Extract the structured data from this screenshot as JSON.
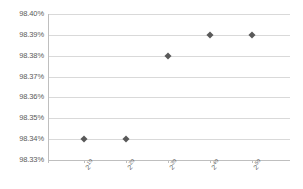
{
  "chart_data": {
    "type": "scatter",
    "title": "",
    "xlabel": "",
    "ylabel": "",
    "categories": [
      "2^10",
      "2^20",
      "2^30",
      "2^40",
      "2^50"
    ],
    "x_tick_labels": [
      {
        "base": "2",
        "exponent": "10"
      },
      {
        "base": "2",
        "exponent": "20"
      },
      {
        "base": "2",
        "exponent": "30"
      },
      {
        "base": "2",
        "exponent": "40"
      },
      {
        "base": "2",
        "exponent": "50"
      }
    ],
    "values": [
      98.34,
      98.34,
      98.38,
      98.39,
      98.39
    ],
    "points": [
      {
        "x": "2^10",
        "y": 98.34,
        "label": "98.34%"
      },
      {
        "x": "2^20",
        "y": 98.34,
        "label": "98.34%"
      },
      {
        "x": "2^30",
        "y": 98.38,
        "label": "98.38%"
      },
      {
        "x": "2^40",
        "y": 98.39,
        "label": "98.39%"
      },
      {
        "x": "2^50",
        "y": 98.39,
        "label": "98.39%"
      }
    ],
    "y_tick_labels": [
      "98.40%",
      "98.39%",
      "98.38%",
      "98.37%",
      "98.36%",
      "98.35%",
      "98.34%",
      "98.33%"
    ],
    "y_tick_values": [
      98.4,
      98.39,
      98.38,
      98.37,
      98.36,
      98.35,
      98.34,
      98.33
    ],
    "ylim": [
      98.33,
      98.4
    ],
    "y_tick_step": 0.01,
    "grid": true,
    "legend": false,
    "legend_position": "none",
    "marker_shape": "diamond",
    "colors": {
      "marker": "#595959",
      "gridline": "#d9d9d9",
      "axis": "#bfbfbf",
      "text": "#5a5a5a",
      "background": "#ffffff"
    }
  }
}
